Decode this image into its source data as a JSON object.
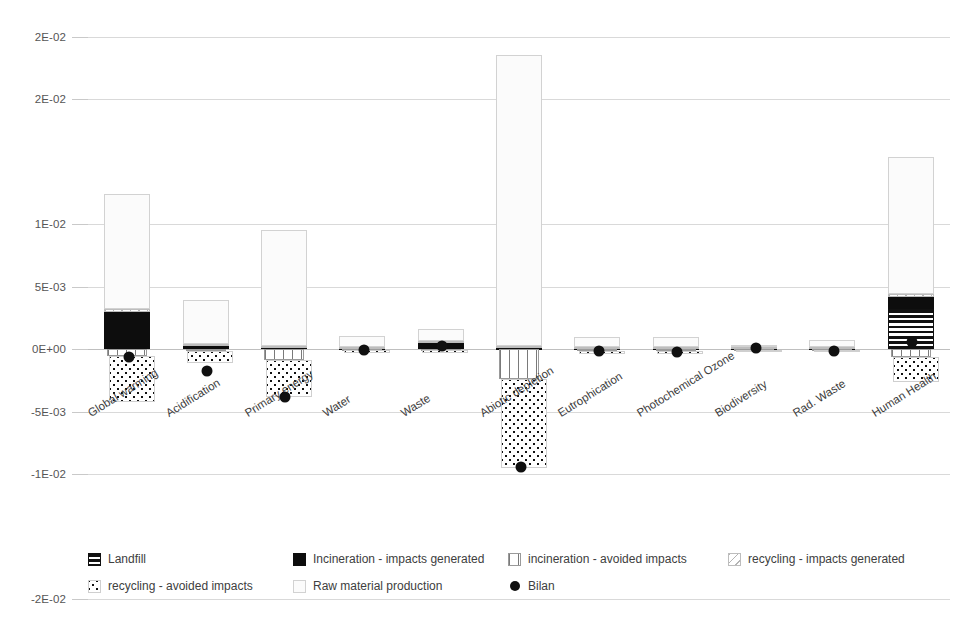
{
  "chart_data": {
    "type": "bar",
    "title": "",
    "subtitle": "",
    "xlabel": "",
    "ylabel": "",
    "stacked": true,
    "grid": true,
    "legend_position": "bottom",
    "ylim": [
      -0.02,
      0.03
    ],
    "ytick_labels": [
      "3E-02",
      "2E-02",
      "2E-02",
      "1E-02",
      "5E-03",
      "0E+00",
      "-5E-03",
      "-1E-02",
      "-2E-02"
    ],
    "ytick_values": [
      0.03,
      0.025,
      0.02,
      0.01,
      0.005,
      0.0,
      -0.005,
      -0.01,
      -0.02
    ],
    "categories": [
      "Global warming",
      "Acidification",
      "Primary energy",
      "Water",
      "Waste",
      "Abiotic depletion",
      "Eutrophication",
      "Photochemical Ozone",
      "Biodiversity",
      "Rad. Waste",
      "Human Health"
    ],
    "series": [
      {
        "name": "Landfill",
        "pattern": "horizontal-lines",
        "values": [
          0,
          0,
          0,
          0,
          0,
          0,
          0,
          0,
          0,
          0,
          0.0032
        ]
      },
      {
        "name": "Incineration - impacts generated",
        "pattern": "solid-black",
        "values": [
          0.003,
          0.0003,
          0.00015,
          0.00012,
          0.00055,
          0.00012,
          0.00012,
          0.0001,
          8e-05,
          8e-05,
          0.001
        ]
      },
      {
        "name": "incineration - avoided impacts",
        "pattern": "vertical-lines",
        "values": [
          -0.00055,
          -0.00018,
          -0.00085,
          -0.0001,
          -0.0001,
          -0.0024,
          -0.00012,
          -0.00012,
          -5e-05,
          -8e-05,
          -0.0006
        ]
      },
      {
        "name": "recycling - impacts generated",
        "pattern": "light-diagonal",
        "values": [
          0.00022,
          0.00012,
          0.0001,
          8e-05,
          0.00012,
          0.0001,
          8e-05,
          0.0001,
          5e-05,
          6e-05,
          0.0002
        ]
      },
      {
        "name": "recycling - avoided impacts",
        "pattern": "dotted",
        "values": [
          -0.0037,
          -0.00095,
          -0.003,
          -0.0002,
          -0.00018,
          -0.0071,
          -0.00028,
          -0.0003,
          -0.0001,
          -0.00018,
          -0.002
        ]
      },
      {
        "name": "Raw material production",
        "pattern": "open-white",
        "values": [
          0.0092,
          0.0035,
          0.0093,
          0.00085,
          0.0009,
          0.0233,
          0.00075,
          0.00075,
          0.0002,
          0.00055,
          0.011
        ]
      }
    ],
    "bilan": {
      "name": "Bilan",
      "marker": "filled-circle",
      "values": [
        -0.0006,
        -0.00175,
        -0.0038,
        -0.0001,
        0.00022,
        -0.0094,
        -0.00012,
        -0.00022,
        5e-05,
        -0.00012,
        0.0006
      ]
    },
    "colors": {
      "incineration_generated": "#0d0d0d",
      "bilan_marker": "#101010",
      "raw_material_fill": "#fbfbfb",
      "raw_material_border": "#d2d2d2",
      "gridline": "#d9d9d9",
      "axis_text": "#555555"
    }
  },
  "legend": {
    "rows": [
      [
        {
          "key": "landfill-swatch",
          "label": "Landfill"
        },
        {
          "key": "incineration-generated-swatch",
          "label": "Incineration - impacts generated"
        },
        {
          "key": "incineration-avoided-swatch",
          "label": "incineration - avoided impacts"
        },
        {
          "key": "recycling-generated-swatch",
          "label": "recycling - impacts generated"
        }
      ],
      [
        {
          "key": "recycling-avoided-swatch",
          "label": "recycling - avoided impacts"
        },
        {
          "key": "raw-material-swatch",
          "label": "Raw material production"
        },
        {
          "key": "bilan-marker-swatch",
          "label": "Bilan"
        }
      ]
    ]
  }
}
